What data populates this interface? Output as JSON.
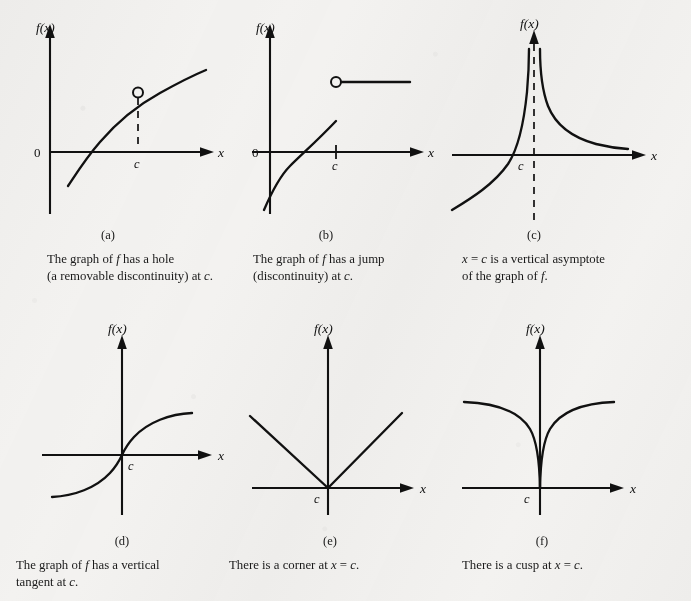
{
  "figure": {
    "background_color": "#f3f2f0",
    "ink_color": "#111111"
  },
  "axis_labels": {
    "y": "f(x)",
    "x": "x",
    "origin": "0",
    "point": "c"
  },
  "panels": [
    {
      "id": "a",
      "label": "(a)",
      "caption_line1": "The graph of f has a hole",
      "caption_line2": "(a removable discontinuity) at c.",
      "concept": "removable-discontinuity"
    },
    {
      "id": "b",
      "label": "(b)",
      "caption_line1": "The graph of f has a jump",
      "caption_line2": "(discontinuity) at c.",
      "concept": "jump-discontinuity"
    },
    {
      "id": "c",
      "label": "(c)",
      "caption_line1": "x = c is a vertical asymptote",
      "caption_line2": "of the graph of f.",
      "concept": "vertical-asymptote"
    },
    {
      "id": "d",
      "label": "(d)",
      "caption_line1": "The graph of f has a vertical",
      "caption_line2": "tangent at c.",
      "concept": "vertical-tangent"
    },
    {
      "id": "e",
      "label": "(e)",
      "caption_line1": "There is a corner at x = c.",
      "caption_line2": "",
      "concept": "corner"
    },
    {
      "id": "f",
      "label": "(f)",
      "caption_line1": "There is a cusp at x = c.",
      "caption_line2": "",
      "concept": "cusp"
    }
  ]
}
